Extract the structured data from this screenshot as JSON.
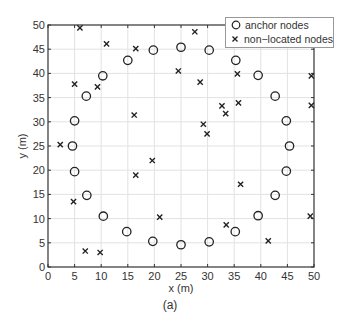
{
  "chart_data": {
    "type": "scatter",
    "title": "",
    "caption": "(a)",
    "xlabel": "x (m)",
    "ylabel": "y (m)",
    "xlim": [
      0,
      50
    ],
    "ylim": [
      0,
      50
    ],
    "xticks": [
      0,
      5,
      10,
      15,
      20,
      25,
      30,
      35,
      40,
      45,
      50
    ],
    "yticks": [
      0,
      5,
      10,
      15,
      20,
      25,
      30,
      35,
      40,
      45,
      50
    ],
    "grid": true,
    "legend_position": "upper right",
    "series": [
      {
        "name": "anchor nodes",
        "marker": "circle",
        "points": [
          [
            5.0,
            30.2
          ],
          [
            4.6,
            25.0
          ],
          [
            5.0,
            19.7
          ],
          [
            7.2,
            35.3
          ],
          [
            7.3,
            14.8
          ],
          [
            10.3,
            39.5
          ],
          [
            10.4,
            10.5
          ],
          [
            15.0,
            42.7
          ],
          [
            14.8,
            7.3
          ],
          [
            19.8,
            44.8
          ],
          [
            19.7,
            5.3
          ],
          [
            25.0,
            45.4
          ],
          [
            25.0,
            4.6
          ],
          [
            30.3,
            44.8
          ],
          [
            30.3,
            5.2
          ],
          [
            35.3,
            42.7
          ],
          [
            35.2,
            7.3
          ],
          [
            39.5,
            39.6
          ],
          [
            39.5,
            10.6
          ],
          [
            42.7,
            35.3
          ],
          [
            42.7,
            14.8
          ],
          [
            44.8,
            30.2
          ],
          [
            44.8,
            19.8
          ],
          [
            45.4,
            25.0
          ]
        ]
      },
      {
        "name": "non-located nodes",
        "marker": "x",
        "points": [
          [
            6.0,
            49.4
          ],
          [
            11.0,
            46.1
          ],
          [
            16.5,
            45.1
          ],
          [
            5.0,
            37.8
          ],
          [
            9.3,
            37.2
          ],
          [
            16.2,
            31.4
          ],
          [
            2.3,
            25.3
          ],
          [
            4.8,
            13.5
          ],
          [
            7.0,
            3.3
          ],
          [
            9.8,
            3.0
          ],
          [
            19.6,
            22.0
          ],
          [
            16.5,
            19.0
          ],
          [
            21.0,
            10.3
          ],
          [
            27.6,
            48.6
          ],
          [
            24.5,
            40.5
          ],
          [
            28.6,
            38.2
          ],
          [
            32.7,
            33.3
          ],
          [
            33.4,
            31.7
          ],
          [
            29.2,
            29.5
          ],
          [
            29.9,
            27.5
          ],
          [
            35.6,
            39.9
          ],
          [
            35.8,
            33.9
          ],
          [
            36.2,
            17.1
          ],
          [
            33.5,
            8.7
          ],
          [
            41.4,
            5.4
          ],
          [
            49.5,
            39.5
          ],
          [
            49.5,
            33.4
          ],
          [
            49.3,
            10.5
          ]
        ]
      }
    ]
  },
  "legend": {
    "items": [
      {
        "label": "anchor nodes",
        "symbol": "circle"
      },
      {
        "label": "non−located nodes",
        "symbol": "x"
      }
    ]
  },
  "axes": {
    "xlabel": "x (m)",
    "ylabel": "y (m)"
  },
  "caption": "(a)",
  "colors": {
    "marker": "#222222",
    "axis": "#333333",
    "grid": "#e2e2e2",
    "legend_border": "#999999"
  }
}
